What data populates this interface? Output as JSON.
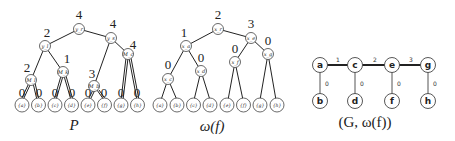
{
  "panels": {
    "p": {
      "caption": "P",
      "internal": [
        {
          "id": "yr",
          "label": "y_r",
          "weight": "4"
        },
        {
          "id": "yl",
          "label": "y_l",
          "weight": "2"
        },
        {
          "id": "ys",
          "label": "y_s",
          "weight": "4"
        },
        {
          "id": "m1",
          "label": "M_l",
          "weight": "2"
        },
        {
          "id": "m2",
          "label": "M_k",
          "weight": "1"
        },
        {
          "id": "m3",
          "label": "M_b",
          "weight": "3"
        },
        {
          "id": "m4",
          "label": "M_c",
          "weight": "4"
        }
      ],
      "leaves": [
        "{a}",
        "{b}",
        "{c}",
        "{d}",
        "{e}",
        "{f}",
        "{g}",
        "{h}"
      ],
      "leaf_edge_weights": [
        "0",
        "0",
        "0",
        "0",
        "0",
        "0",
        "0",
        "0"
      ]
    },
    "omega": {
      "caption": "ω(f)",
      "internal": [
        {
          "id": "x1",
          "label": "x_r",
          "weight": "2"
        },
        {
          "id": "x2",
          "label": "x_a",
          "weight": "1"
        },
        {
          "id": "x3",
          "label": "x_e",
          "weight": "3"
        },
        {
          "id": "x4",
          "label": "x_c",
          "weight": "0"
        },
        {
          "id": "x5",
          "label": "x_d",
          "weight": "0"
        },
        {
          "id": "x6",
          "label": "x_f",
          "weight": "0"
        },
        {
          "id": "x7",
          "label": "x_g",
          "weight": "0"
        }
      ],
      "leaves": [
        "{a}",
        "{b}",
        "{c}",
        "{d}",
        "{e}",
        "{f}",
        "{g}",
        "{h}"
      ]
    },
    "graph": {
      "caption": "(G, ω(f))",
      "top_nodes": [
        "a",
        "c",
        "e",
        "g"
      ],
      "bottom_nodes": [
        "b",
        "d",
        "f",
        "h"
      ],
      "top_edge_weights": [
        "1",
        "2",
        "3"
      ],
      "vertical_edge_weights": [
        "0",
        "0",
        "0",
        "0"
      ]
    }
  }
}
